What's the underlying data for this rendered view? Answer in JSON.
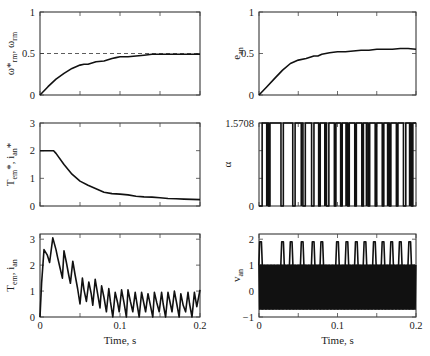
{
  "figure": {
    "background": "#ffffff",
    "line_color": "#111111"
  },
  "chart_data": [
    {
      "id": "speed",
      "type": "line",
      "title": "",
      "xlabel": "",
      "ylabel_main": "ω*",
      "ylabel_sub": "rm",
      "ylabel_main2": ", ω",
      "ylabel_sub2": "rm",
      "xlim": [
        0,
        0.2
      ],
      "ylim": [
        0,
        1
      ],
      "xticks": [
        0,
        0.05,
        0.1,
        0.15,
        0.2
      ],
      "xtick_labels": [],
      "yticks": [
        0,
        0.5,
        1
      ],
      "ytick_labels": [
        "0",
        "0.5",
        "1"
      ],
      "reference": {
        "name": "ω*rm",
        "style": "dashed",
        "value": 0.5
      },
      "series": [
        {
          "name": "ωrm",
          "x": [
            0,
            0.01,
            0.02,
            0.03,
            0.04,
            0.05,
            0.055,
            0.06,
            0.07,
            0.08,
            0.09,
            0.095,
            0.1,
            0.11,
            0.12,
            0.13,
            0.14,
            0.15,
            0.16,
            0.17,
            0.18,
            0.19,
            0.2
          ],
          "y": [
            0,
            0.1,
            0.19,
            0.26,
            0.32,
            0.36,
            0.37,
            0.37,
            0.4,
            0.41,
            0.44,
            0.45,
            0.46,
            0.46,
            0.47,
            0.48,
            0.49,
            0.49,
            0.49,
            0.49,
            0.49,
            0.49,
            0.49
          ]
        }
      ]
    },
    {
      "id": "efficiency-control",
      "type": "line",
      "xlabel": "",
      "ylabel_main": "e",
      "ylabel_sub": "an",
      "xlim": [
        0,
        0.2
      ],
      "ylim": [
        0,
        1
      ],
      "xticks": [
        0,
        0.05,
        0.1,
        0.15,
        0.2
      ],
      "xtick_labels": [],
      "yticks": [
        0,
        0.5,
        1
      ],
      "ytick_labels": [
        "0",
        "0.5",
        "1"
      ],
      "series": [
        {
          "name": "ean",
          "x": [
            0,
            0.01,
            0.02,
            0.03,
            0.04,
            0.05,
            0.06,
            0.07,
            0.075,
            0.08,
            0.09,
            0.1,
            0.11,
            0.12,
            0.13,
            0.14,
            0.15,
            0.16,
            0.17,
            0.18,
            0.19,
            0.2
          ],
          "y": [
            0,
            0.1,
            0.2,
            0.3,
            0.38,
            0.42,
            0.44,
            0.47,
            0.47,
            0.49,
            0.51,
            0.52,
            0.52,
            0.53,
            0.54,
            0.54,
            0.55,
            0.55,
            0.55,
            0.56,
            0.56,
            0.55
          ]
        }
      ]
    },
    {
      "id": "torque-reference",
      "type": "line",
      "xlabel": "",
      "ylabel_main": "T",
      "ylabel_sub": "em",
      "ylabel_main2": "*, i",
      "ylabel_sub2": "an",
      "ylabel_tail": "*",
      "xlim": [
        0,
        0.2
      ],
      "ylim": [
        0,
        3
      ],
      "xticks": [
        0,
        0.05,
        0.1,
        0.15,
        0.2
      ],
      "xtick_labels": [],
      "yticks": [
        0,
        1,
        2,
        3
      ],
      "ytick_labels": [
        "0",
        "1",
        "2",
        "3"
      ],
      "series": [
        {
          "name": "T*em",
          "x": [
            0,
            0.01,
            0.017,
            0.02,
            0.03,
            0.04,
            0.05,
            0.06,
            0.07,
            0.08,
            0.09,
            0.1,
            0.11,
            0.12,
            0.13,
            0.14,
            0.15,
            0.16,
            0.17,
            0.18,
            0.19,
            0.2
          ],
          "y": [
            2,
            2,
            2,
            1.9,
            1.5,
            1.15,
            0.9,
            0.75,
            0.62,
            0.5,
            0.45,
            0.43,
            0.4,
            0.35,
            0.33,
            0.32,
            0.3,
            0.27,
            0.26,
            0.25,
            0.24,
            0.23
          ]
        }
      ]
    },
    {
      "id": "firing-angle",
      "type": "line",
      "xlabel": "",
      "ylabel_main": "α",
      "xlim": [
        0,
        0.2
      ],
      "ylim": [
        0,
        1.5708
      ],
      "xticks": [
        0,
        0.05,
        0.1,
        0.15,
        0.2
      ],
      "xtick_labels": [],
      "yticks": [
        0,
        1.5708
      ],
      "ytick_labels": [
        "0",
        "1.5708"
      ],
      "series": [
        {
          "name": "α",
          "pulse_low_intervals": [
            [
              0.0,
              0.004
            ],
            [
              0.012,
              0.014
            ],
            [
              0.028,
              0.031
            ],
            [
              0.043,
              0.046
            ],
            [
              0.056,
              0.059
            ],
            [
              0.067,
              0.07
            ],
            [
              0.076,
              0.078
            ],
            [
              0.086,
              0.089
            ],
            [
              0.096,
              0.098
            ],
            [
              0.104,
              0.106
            ],
            [
              0.113,
              0.115
            ],
            [
              0.122,
              0.124
            ],
            [
              0.131,
              0.133
            ],
            [
              0.139,
              0.141
            ],
            [
              0.148,
              0.15
            ],
            [
              0.157,
              0.159
            ],
            [
              0.166,
              0.168
            ],
            [
              0.175,
              0.177
            ],
            [
              0.184,
              0.187
            ],
            [
              0.194,
              0.196
            ]
          ],
          "high": 1.5708,
          "low": 0
        }
      ]
    },
    {
      "id": "current",
      "type": "line",
      "xlabel": "Time, s",
      "ylabel_main": "T",
      "ylabel_sub": "em",
      "ylabel_main2": ", i",
      "ylabel_sub2": "an",
      "xlim": [
        0,
        0.2
      ],
      "ylim": [
        0,
        3.2
      ],
      "xticks": [
        0,
        0.05,
        0.1,
        0.15,
        0.2
      ],
      "xtick_labels": [
        "0",
        "",
        "0.1",
        "",
        "0.2"
      ],
      "yticks": [
        0,
        1,
        2,
        3
      ],
      "ytick_labels": [
        "0",
        "1",
        "2",
        "3"
      ],
      "series": [
        {
          "name": "ian",
          "x": [
            0,
            0.002,
            0.005,
            0.009,
            0.012,
            0.016,
            0.02,
            0.022,
            0.025,
            0.028,
            0.03,
            0.033,
            0.036,
            0.038,
            0.041,
            0.044,
            0.047,
            0.05,
            0.053,
            0.055,
            0.058,
            0.061,
            0.064,
            0.066,
            0.069,
            0.072,
            0.075,
            0.077,
            0.08,
            0.083,
            0.086,
            0.088,
            0.091,
            0.094,
            0.097,
            0.099,
            0.102,
            0.105,
            0.108,
            0.11,
            0.113,
            0.116,
            0.119,
            0.121,
            0.124,
            0.127,
            0.13,
            0.132,
            0.135,
            0.138,
            0.141,
            0.143,
            0.146,
            0.149,
            0.152,
            0.154,
            0.157,
            0.16,
            0.163,
            0.165,
            0.168,
            0.171,
            0.174,
            0.176,
            0.179,
            0.182,
            0.185,
            0.187,
            0.19,
            0.193,
            0.196,
            0.2
          ],
          "y": [
            0,
            1.3,
            2.6,
            2.4,
            2.1,
            3.05,
            2.6,
            2.3,
            1.9,
            1.5,
            2.55,
            2.1,
            1.6,
            1.3,
            2.15,
            1.6,
            1.1,
            0.5,
            1.5,
            1.05,
            0.6,
            1.35,
            0.9,
            0.45,
            1.45,
            0.9,
            0.35,
            1.2,
            0.75,
            0.2,
            1.1,
            0.6,
            0.0,
            0.95,
            0.55,
            0.2,
            1.05,
            0.55,
            0.0,
            1.05,
            0.6,
            0.2,
            0.95,
            0.55,
            0.0,
            0.95,
            0.5,
            0.2,
            0.9,
            0.45,
            0.0,
            0.95,
            0.55,
            0.2,
            0.95,
            0.5,
            0.0,
            0.95,
            0.5,
            0.2,
            1.0,
            0.5,
            0.0,
            0.9,
            0.45,
            0.2,
            0.95,
            0.5,
            0.0,
            0.95,
            0.4,
            1.05
          ]
        }
      ]
    },
    {
      "id": "voltage",
      "type": "line",
      "xlabel": "Time, s",
      "ylabel_main": "v",
      "ylabel_sub": "an",
      "xlim": [
        0,
        0.2
      ],
      "ylim": [
        -1,
        2.2
      ],
      "xticks": [
        0,
        0.05,
        0.1,
        0.15,
        0.2
      ],
      "xtick_labels": [
        "0",
        "",
        "0.1",
        "",
        "0.2"
      ],
      "yticks": [
        -1,
        0,
        1,
        2
      ],
      "ytick_labels": [
        "−1",
        "0",
        "1",
        "2"
      ],
      "series": [
        {
          "name": "van",
          "spike_times": [
            0.002,
            0.03,
            0.041,
            0.055,
            0.069,
            0.08,
            0.1,
            0.112,
            0.124,
            0.135,
            0.147,
            0.158,
            0.169,
            0.18,
            0.192
          ],
          "spike_peak": 1.9,
          "band_high": 1.0,
          "band_low": -0.7
        }
      ]
    }
  ]
}
